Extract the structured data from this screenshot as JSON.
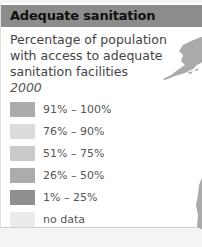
{
  "header": {
    "title": "Adequate sanitation"
  },
  "description": "Percentage of population with access to adequate sanitation facilities",
  "year": "2000",
  "legend": [
    {
      "label": "91% – 100%",
      "color": "#ababab"
    },
    {
      "label": "76% – 90%",
      "color": "#dcdcdc"
    },
    {
      "label": "51% – 75%",
      "color": "#cacaca"
    },
    {
      "label": "26% – 50%",
      "color": "#acacac"
    },
    {
      "label": "1% – 25%",
      "color": "#8f8f8f"
    },
    {
      "label": "no data",
      "color": "#ebebeb"
    }
  ]
}
